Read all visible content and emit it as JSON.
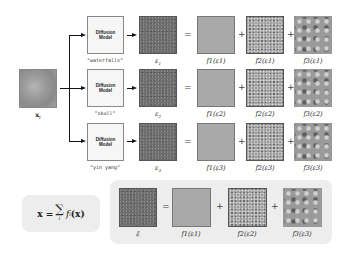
{
  "input": {
    "label": "x_t",
    "label_text": "x",
    "label_sub": "t"
  },
  "diffusion_model_label": [
    "Diffusion",
    "Model"
  ],
  "rows": [
    {
      "prompt": "\"waterfalls\"",
      "eps_label": "ε",
      "eps_sub": "1",
      "f_labels": [
        "f1(ε1)",
        "f2(ε1)",
        "f3(ε1)"
      ]
    },
    {
      "prompt": "\"skull\"",
      "eps_label": "ε",
      "eps_sub": "2",
      "f_labels": [
        "f1(ε2)",
        "f2(ε2)",
        "f3(ε2)"
      ]
    },
    {
      "prompt": "\"yin yang\"",
      "eps_label": "ε",
      "eps_sub": "3",
      "f_labels": [
        "f1(ε3)",
        "f2(ε3)",
        "f3(ε3)"
      ]
    }
  ],
  "operators": {
    "equals": "=",
    "plus": "+"
  },
  "formula": {
    "lhs": "x = ",
    "sum": "∑",
    "sum_index": "i",
    "rhs": "f",
    "rhs_sub": "i",
    "rhs_arg": "(x)"
  },
  "combined": {
    "eps_label": "ε̃",
    "f_labels": [
      "f1(ε1)",
      "f2(ε2)",
      "f3(ε3)"
    ]
  }
}
